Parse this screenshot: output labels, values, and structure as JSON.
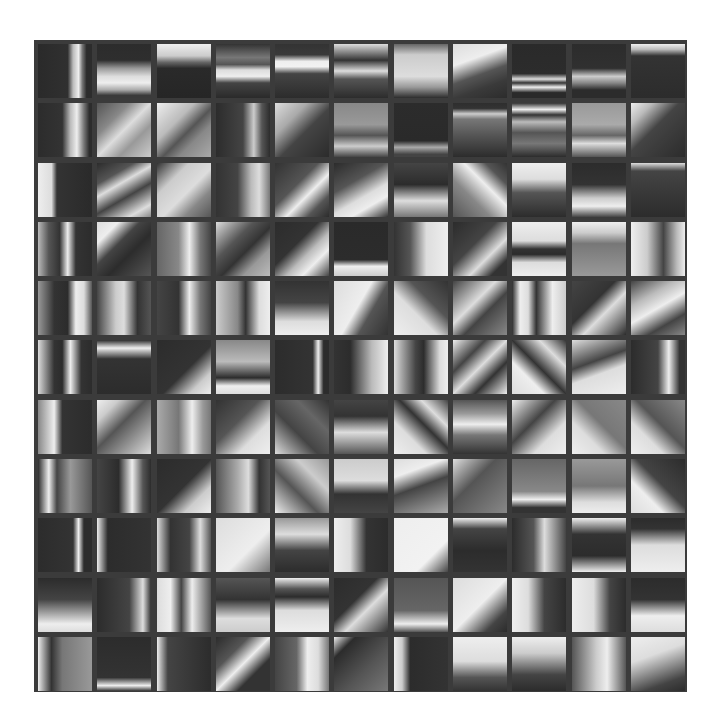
{
  "figure": {
    "rows": 11,
    "cols": 11,
    "frame_color": "#3b3b3b",
    "background": "#ffffff"
  },
  "tiles": [
    [
      "linear-gradient(90deg,#2a2a2a 0%,#303030 55%,#bbb 65%,#eee 75%,#777 82%,#2c2c2c 90%)",
      "linear-gradient(180deg,#2c2c2c 0%,#2e2e2e 30%,#999 45%,#ddd 60%,#eee 72%,#aaa 85%,#3a3a3a 95%)",
      "linear-gradient(180deg,#eee 0%,#ccc 22%,#666 34%,#2a2a2a 45%,#262626 100%)",
      "linear-gradient(180deg,#333 0%,#777 25%,#555 38%,#ddd 48%,#eee 60%,#444 72%,#2a2a2a 100%)",
      "linear-gradient(180deg,#333 0%,#3a3a3a 20%,#eee 32%,#f2f2f2 42%,#444 55%,#2c2c2c 100%)",
      "linear-gradient(180deg,#ddd 0%,#888 15%,#333 30%,#ddd 50%,#555 65%,#2c2c2c 100%)",
      "linear-gradient(180deg,#666 0%,#ccc 20%,#ddd 60%,#999 80%,#2c2c2c 100%)",
      "linear-gradient(160deg,#ddd 0%,#eee 30%,#555 55%,#3a3a3a 75%,#2c2c2c 100%)",
      "linear-gradient(180deg,#2a2a2a 0%,#2c2c2c 55%,#ddd 65%,#333 72%,#eee 80%,#2a2a2a 90%)",
      "linear-gradient(180deg,#2c2c2c 0%,#303030 45%,#ccc 60%,#888 72%,#2c2c2c 85%)",
      "linear-gradient(180deg,#eee 0%,#bbb 10%,#333 22%,#2c2c2c 100%)"
    ],
    [
      "linear-gradient(90deg,#2c2c2c 0%,#333 45%,#bbb 60%,#eee 72%,#777 85%,#2c2c2c 95%)",
      "linear-gradient(135deg,#555 0%,#888 30%,#ddd 50%,#999 70%,#ccc 100%)",
      "linear-gradient(135deg,#eee 0%,#bbb 35%,#555 55%,#888 70%,#aaa 100%)",
      "linear-gradient(90deg,#2c2c2c 0%,#444 50%,#ccc 70%,#555 85%,#2c2c2c 100%)",
      "linear-gradient(135deg,#ddd 0%,#aaa 30%,#444 55%,#2c2c2c 100%)",
      "linear-gradient(180deg,#888 0%,#999 40%,#555 60%,#ccc 80%,#444 100%)",
      "linear-gradient(180deg,#2c2c2c 0%,#2a2a2a 70%,#aaa 82%,#444 95%)",
      "linear-gradient(180deg,#2e2e2e 0%,#333 10%,#ccc 20%,#777 30%,#555 60%,#2c2c2c 100%)",
      "linear-gradient(180deg,#333 0%,#eee 12%,#333 22%,#bbb 35%,#555 55%,#777 75%,#2c2c2c 100%)",
      "linear-gradient(180deg,#999 0%,#aaa 40%,#666 60%,#ddd 75%,#555 100%)",
      "linear-gradient(135deg,#eee 0%,#bbb 20%,#444 45%,#2c2c2c 100%)"
    ],
    [
      "linear-gradient(90deg,#eee 0%,#ddd 25%,#333 35%,#2a2a2a 100%)",
      "linear-gradient(150deg,#2c2c2c 0%,#555 25%,#ddd 40%,#444 60%,#ddd 85%,#888 100%)",
      "linear-gradient(135deg,#333 0%,#ccc 30%,#ddd 55%,#888 75%,#555 100%)",
      "linear-gradient(90deg,#333 0%,#444 40%,#bbb 65%,#ddd 80%,#777 100%)",
      "linear-gradient(135deg,#333 0%,#555 40%,#eee 60%,#555 80%,#2c2c2c 100%)",
      "linear-gradient(150deg,#2c2c2c 0%,#555 35%,#ddd 60%,#eee 75%,#333 100%)",
      "linear-gradient(180deg,#444 0%,#2c2c2c 40%,#ddd 70%,#777 100%)",
      "linear-gradient(45deg,#555 0%,#888 35%,#eee 60%,#555 80%,#333 100%)",
      "linear-gradient(180deg,#eee 0%,#ddd 30%,#555 55%,#2c2c2c 100%)",
      "linear-gradient(180deg,#2c2c2c 0%,#333 40%,#ccc 65%,#eee 80%,#444 100%)",
      "linear-gradient(180deg,#ddd 0%,#444 15%,#2c2c2c 100%)"
    ],
    [
      "linear-gradient(90deg,#bbb 0%,#555 20%,#333 40%,#eee 55%,#333 70%,#2c2c2c 100%)",
      "linear-gradient(135deg,#ddd 0%,#eee 20%,#444 40%,#2c2c2c 60%,#555 100%)",
      "linear-gradient(90deg,#666 0%,#888 40%,#eee 60%,#777 80%,#444 100%)",
      "linear-gradient(135deg,#ddd 0%,#555 35%,#333 55%,#999 75%,#bbb 100%)",
      "linear-gradient(135deg,#2c2c2c 0%,#333 40%,#bbb 60%,#eee 75%,#444 100%)",
      "linear-gradient(180deg,#2a2a2a 0%,#2c2c2c 70%,#eee 82%,#ccc 100%)",
      "linear-gradient(90deg,#333 0%,#555 30%,#ddd 60%,#eee 100%)",
      "linear-gradient(135deg,#2c2c2c 0%,#444 40%,#ddd 65%,#333 85%)",
      "linear-gradient(180deg,#eee 0%,#ddd 35%,#333 50%,#2c2c2c 60%,#ddd 75%,#eee 100%)",
      "linear-gradient(180deg,#eee 0%,#ccc 20%,#777 40%,#999 100%)",
      "linear-gradient(90deg,#eee 0%,#ccc 30%,#444 60%,#bbb 85%,#eee 100%)"
    ],
    [
      "linear-gradient(90deg,#999 0%,#333 30%,#2c2c2c 55%,#eee 70%,#ddd 85%,#555 100%)",
      "linear-gradient(90deg,#444 0%,#ccc 35%,#ddd 50%,#333 75%,#555 100%)",
      "linear-gradient(90deg,#444 0%,#333 40%,#eee 60%,#777 80%,#444 100%)",
      "linear-gradient(90deg,#ccc 0%,#888 40%,#333 55%,#ddd 80%,#eee 100%)",
      "linear-gradient(180deg,#333 0%,#444 40%,#ddd 75%,#eee 100%)",
      "linear-gradient(120deg,#ddd 0%,#eee 45%,#555 65%,#333 100%)",
      "linear-gradient(45deg,#eee 0%,#ddd 40%,#555 65%,#333 100%)",
      "linear-gradient(135deg,#444 0%,#ddd 40%,#444 60%,#888 100%)",
      "linear-gradient(90deg,#2c2c2c 0%,#eee 15%,#ddd 30%,#333 45%,#eee 75%,#ccc 100%)",
      "linear-gradient(135deg,#444 0%,#333 40%,#ddd 60%,#2c2c2c 100%)",
      "linear-gradient(150deg,#444 0%,#bbb 30%,#eee 50%,#444 75%,#888 100%)"
    ],
    [
      "linear-gradient(90deg,#ddd 0%,#333 30%,#2c2c2c 45%,#eee 60%,#333 80%,#2c2c2c 100%)",
      "linear-gradient(180deg,#2c2c2c 0%,#eee 15%,#333 35%,#2c2c2c 100%)",
      "linear-gradient(135deg,#2c2c2c 0%,#333 55%,#ccc 80%,#eee 100%)",
      "linear-gradient(180deg,#888 0%,#bbb 40%,#2c2c2c 70%,#eee 85%,#ddd 100%)",
      "linear-gradient(90deg,#2c2c2c 0%,#333 70%,#eee 80%,#2c2c2c 90%)",
      "linear-gradient(90deg,#333 0%,#2c2c2c 30%,#bbb 70%,#eee 100%)",
      "linear-gradient(90deg,#ddd 0%,#444 40%,#2c2c2c 55%,#ddd 85%,#eee 100%)",
      "linear-gradient(135deg,#eee 0%,#444 30%,#ddd 50%,#333 70%,#eee 100%)",
      "linear-gradient(45deg,#ddd 0%,#eee 30%,#333 50%,#ddd 75%,#333 100%)",
      "linear-gradient(160deg,#ddd 0%,#444 40%,#ddd 60%,#eee 100%)",
      "linear-gradient(90deg,#2c2c2c 0%,#444 50%,#eee 70%,#333 90%)"
    ],
    [
      "linear-gradient(90deg,#888 0%,#eee 30%,#333 45%,#2c2c2c 100%)",
      "linear-gradient(135deg,#eee 0%,#ccc 20%,#555 45%,#ddd 100%)",
      "linear-gradient(90deg,#aaa 0%,#777 40%,#eee 65%,#999 85%,#777 100%)",
      "linear-gradient(135deg,#333 0%,#555 40%,#ddd 70%,#eee 100%)",
      "linear-gradient(45deg,#ddd 0%,#444 40%,#666 70%,#333 100%)",
      "linear-gradient(180deg,#444 0%,#333 30%,#ddd 60%,#555 100%)",
      "linear-gradient(45deg,#eee 0%,#ddd 30%,#333 55%,#ddd 75%,#444 100%)",
      "linear-gradient(180deg,#555 0%,#999 25%,#eee 45%,#777 65%,#333 100%)",
      "linear-gradient(135deg,#eee 0%,#444 40%,#ddd 70%,#eee 100%)",
      "linear-gradient(45deg,#eee 0%,#ddd 30%,#777 55%,#888 100%)",
      "linear-gradient(45deg,#eee 0%,#ddd 30%,#555 55%,#888 100%)"
    ],
    [
      "linear-gradient(90deg,#2c2c2c 0%,#eee 20%,#444 35%,#999 60%,#555 100%)",
      "linear-gradient(90deg,#444 0%,#2c2c2c 40%,#eee 65%,#555 85%,#2c2c2c 100%)",
      "linear-gradient(135deg,#2c2c2c 0%,#333 50%,#ccc 75%,#eee 100%)",
      "linear-gradient(90deg,#555 0%,#aaa 40%,#ddd 60%,#333 80%,#555 100%)",
      "linear-gradient(45deg,#eee 0%,#555 40%,#ccc 70%,#999 100%)",
      "linear-gradient(180deg,#ccc 0%,#ddd 40%,#333 65%,#444 100%)",
      "linear-gradient(160deg,#ddd 0%,#eee 25%,#444 50%,#aaa 100%)",
      "linear-gradient(135deg,#ddd 0%,#555 40%,#888 100%)",
      "linear-gradient(180deg,#666 0%,#888 60%,#eee 75%,#333 90%)",
      "linear-gradient(180deg,#999 0%,#777 50%,#ddd 80%,#eee 100%)",
      "linear-gradient(45deg,#ddd 0%,#eee 30%,#444 55%,#2c2c2c 100%)"
    ],
    [
      "linear-gradient(90deg,#2c2c2c 0%,#333 65%,#eee 75%,#2c2c2c 85%)",
      "linear-gradient(90deg,#eee 0%,#2c2c2c 20%,#333 100%)",
      "linear-gradient(90deg,#ddd 0%,#333 25%,#444 60%,#ddd 80%,#555 100%)",
      "linear-gradient(135deg,#ddd 0%,#eee 60%,#777 100%)",
      "linear-gradient(180deg,#999 0%,#ddd 30%,#444 60%,#2c2c2c 100%)",
      "linear-gradient(90deg,#eee 0%,#ddd 30%,#333 60%,#2c2c2c 100%)",
      "linear-gradient(135deg,#eee 0%,#f2f2f2 70%,#444 100%)",
      "linear-gradient(180deg,#eee 0%,#444 20%,#2c2c2c 60%,#333 100%)",
      "linear-gradient(90deg,#2c2c2c 0%,#555 40%,#ddd 60%,#444 100%)",
      "linear-gradient(180deg,#eee 0%,#333 30%,#2c2c2c 70%,#eee 100%)",
      "linear-gradient(180deg,#2c2c2c 0%,#333 20%,#ddd 50%,#eee 100%)"
    ],
    [
      "linear-gradient(180deg,#2c2c2c 0%,#444 40%,#eee 85%,#ddd 100%)",
      "linear-gradient(90deg,#2c2c2c 0%,#444 60%,#ddd 85%,#333 100%)",
      "linear-gradient(90deg,#ddd 0%,#eee 25%,#444 45%,#eee 65%,#555 100%)",
      "linear-gradient(180deg,#555 0%,#333 40%,#ddd 75%,#ccc 100%)",
      "linear-gradient(180deg,#eee 0%,#555 20%,#2c2c2c 35%,#ddd 60%,#eee 100%)",
      "linear-gradient(135deg,#2c2c2c 0%,#333 40%,#ddd 60%,#333 100%)",
      "linear-gradient(180deg,#555 0%,#666 60%,#eee 85%,#555 100%)",
      "linear-gradient(135deg,#ddd 0%,#eee 50%,#444 80%,#2c2c2c 100%)",
      "linear-gradient(90deg,#eee 0%,#ddd 30%,#444 60%,#2c2c2c 100%)",
      "linear-gradient(90deg,#eee 0%,#ddd 40%,#444 70%,#2c2c2c 100%)",
      "linear-gradient(180deg,#2c2c2c 0%,#333 40%,#eee 70%,#ddd 100%)"
    ],
    [
      "linear-gradient(90deg,#eee 0%,#333 25%,#777 45%,#999 100%)",
      "linear-gradient(180deg,#2c2c2c 0%,#333 75%,#eee 90%,#333 100%)",
      "linear-gradient(90deg,#eee 0%,#444 20%,#2c2c2c 100%)",
      "linear-gradient(135deg,#2c2c2c 0%,#555 30%,#eee 50%,#333 70%)",
      "linear-gradient(90deg,#444 0%,#666 40%,#eee 60%,#ddd 80%,#777 100%)",
      "linear-gradient(135deg,#eee 0%,#2c2c2c 20%,#555 60%,#777 100%)",
      "linear-gradient(90deg,#eee 0%,#ccc 15%,#2c2c2c 30%,#333 100%)",
      "linear-gradient(180deg,#eee 0%,#ddd 45%,#555 75%,#333 100%)",
      "linear-gradient(180deg,#eee 0%,#ccc 30%,#444 70%,#2c2c2c 100%)",
      "linear-gradient(90deg,#555 0%,#ccc 45%,#eee 65%,#555 100%)",
      "linear-gradient(160deg,#eee 0%,#ddd 35%,#444 80%,#2c2c2c 100%)"
    ]
  ]
}
